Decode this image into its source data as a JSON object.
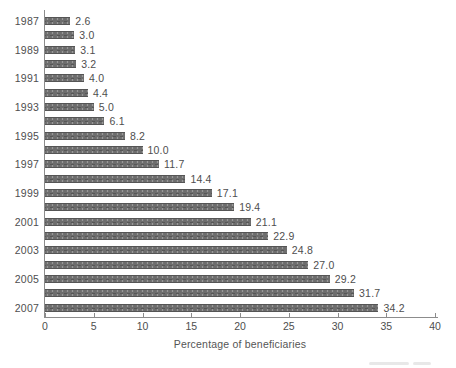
{
  "chart_data": {
    "type": "bar",
    "orientation": "horizontal",
    "title": "",
    "xlabel": "Percentage of beneficiaries",
    "ylabel": "",
    "categories": [
      "1987",
      "1988",
      "1989",
      "1990",
      "1991",
      "1992",
      "1993",
      "1994",
      "1995",
      "1996",
      "1997",
      "1998",
      "1999",
      "2000",
      "2001",
      "2002",
      "2003",
      "2004",
      "2005",
      "2006",
      "2007"
    ],
    "year_labels_shown": [
      "1987",
      "1989",
      "1991",
      "1993",
      "1995",
      "1997",
      "1999",
      "2001",
      "2003",
      "2005",
      "2007"
    ],
    "values": [
      2.6,
      3.0,
      3.1,
      3.2,
      4.0,
      4.4,
      5.0,
      6.1,
      8.2,
      10.0,
      11.7,
      14.4,
      17.1,
      19.4,
      21.1,
      22.9,
      24.8,
      27.0,
      29.2,
      31.7,
      34.2
    ],
    "xticks": [
      0,
      5,
      10,
      15,
      20,
      25,
      30,
      35,
      40
    ],
    "xlim": [
      0,
      40
    ],
    "grid": false,
    "legend": null,
    "colors": {
      "bar": "#6d6d6d",
      "axis": "#8c8c8c",
      "text": "#4e4e4e"
    }
  }
}
